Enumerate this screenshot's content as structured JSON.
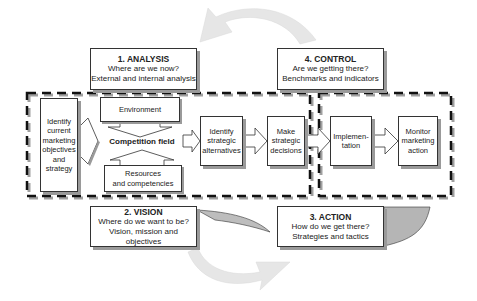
{
  "diagram": {
    "phases": [
      {
        "id": "analysis",
        "title": "1. ANALYSIS",
        "line1": "Where are we now?",
        "line2": "External and internal analysis"
      },
      {
        "id": "vision",
        "title": "2. VISION",
        "line1": "Where do we want to be?",
        "line2": "Vision, mission and objectives"
      },
      {
        "id": "action",
        "title": "3. ACTION",
        "line1": "How do we get there?",
        "line2": "Strategies and tactics"
      },
      {
        "id": "control",
        "title": "4. CONTROL",
        "line1": "Are we getting there?",
        "line2": "Benchmarks and indicators"
      }
    ],
    "steps": {
      "current": "Identify current marketing objectives and strategy",
      "environment": "Environment",
      "competition_field": "Competition field",
      "resources_line1": "Resources",
      "resources_line2": "and competencies",
      "alternatives": "Identify strategic alternatives",
      "decisions": "Make strategic decisions",
      "implementation": "Implemen-tation",
      "monitor": "Monitor marketing action"
    },
    "colors": {
      "border": "#333333",
      "shadow": "#9a9a9a",
      "cycle_arrow": "#e4e4e4",
      "dashed": "#111111"
    }
  }
}
